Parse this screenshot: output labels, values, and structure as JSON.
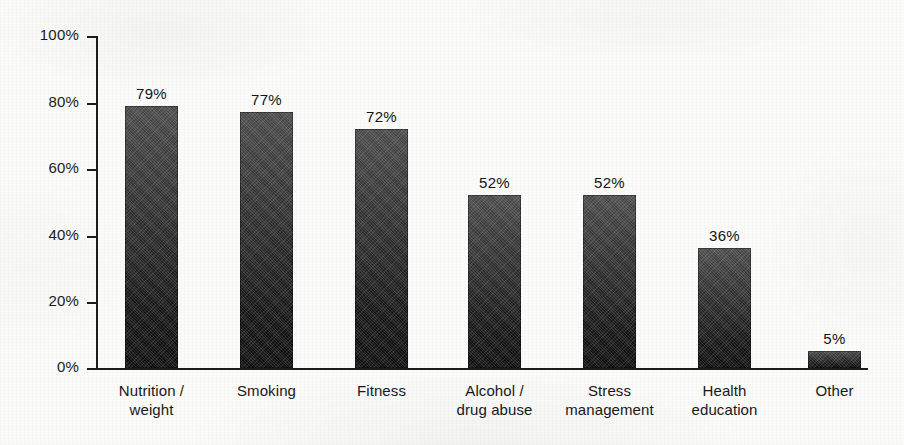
{
  "chart_data": {
    "type": "bar",
    "title": "",
    "subtitle": "",
    "xlabel": "",
    "ylabel": "",
    "ylim": [
      0,
      100
    ],
    "grid": false,
    "legend": "none",
    "y_tick_labels": [
      "100%",
      "80%",
      "60%",
      "40%",
      "20%",
      "0%"
    ],
    "y_ticks": [
      100,
      80,
      60,
      40,
      20,
      0
    ],
    "categories": [
      "Nutrition / weight",
      "Smoking",
      "Fitness",
      "Alcohol / drug abuse",
      "Stress management",
      "Health education",
      "Other"
    ],
    "category_lines": [
      [
        "Nutrition /",
        "weight"
      ],
      [
        "Smoking",
        ""
      ],
      [
        "Fitness",
        ""
      ],
      [
        "Alcohol /",
        "drug abuse"
      ],
      [
        "Stress",
        "management"
      ],
      [
        "Health",
        "education"
      ],
      [
        "Other",
        ""
      ]
    ],
    "values": [
      79,
      77,
      72,
      52,
      52,
      36,
      5
    ],
    "value_labels": [
      "79%",
      "77%",
      "72%",
      "52%",
      "52%",
      "36%",
      "5%"
    ],
    "bar_color": "#2a2a2a",
    "axis_color": "#1c1c1c",
    "background_color": "#fbfbfa"
  }
}
